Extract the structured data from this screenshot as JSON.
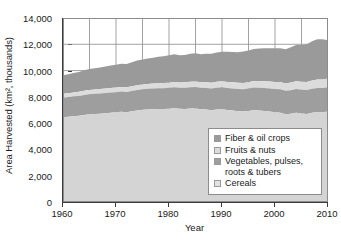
{
  "chart_data": {
    "type": "area",
    "title": "",
    "xlabel": "Year",
    "ylabel": "Area Harvested (km², thousands)",
    "xlim": [
      1960,
      2010
    ],
    "ylim": [
      0,
      14000
    ],
    "stacked": true,
    "grid": true,
    "grid_axis": "both",
    "legend_position": "inside-bottom-right",
    "ytick_labels": [
      "14,000",
      "12,000",
      "10,000",
      "8,000",
      "6,000",
      "4,000",
      "2,000",
      "0"
    ],
    "ytick_values": [
      14000,
      12000,
      10000,
      8000,
      6000,
      4000,
      2000,
      0
    ],
    "xtick_labels": [
      "1960",
      "1970",
      "1980",
      "1990",
      "2000",
      "2010"
    ],
    "xtick_values": [
      1960,
      1970,
      1980,
      1990,
      2000,
      2010
    ],
    "x": [
      1960,
      1961,
      1962,
      1963,
      1964,
      1965,
      1966,
      1967,
      1968,
      1969,
      1970,
      1971,
      1972,
      1973,
      1974,
      1975,
      1976,
      1977,
      1978,
      1979,
      1980,
      1981,
      1982,
      1983,
      1984,
      1985,
      1986,
      1987,
      1988,
      1989,
      1990,
      1991,
      1992,
      1993,
      1994,
      1995,
      1996,
      1997,
      1998,
      1999,
      2000,
      2001,
      2002,
      2003,
      2004,
      2005,
      2006,
      2007,
      2008,
      2009,
      2010
    ],
    "series": [
      {
        "name": "Cereals",
        "color": "#d4d4d4",
        "values": [
          6450,
          6480,
          6520,
          6560,
          6620,
          6680,
          6700,
          6720,
          6760,
          6800,
          6830,
          6860,
          6820,
          6900,
          6960,
          7010,
          7040,
          7060,
          7080,
          7070,
          7090,
          7130,
          7090,
          7080,
          7110,
          7120,
          7060,
          7030,
          6980,
          7040,
          7060,
          7000,
          6960,
          6900,
          6880,
          6920,
          6990,
          6960,
          6930,
          6890,
          6830,
          6800,
          6680,
          6720,
          6790,
          6740,
          6700,
          6790,
          6840,
          6820,
          6880
        ]
      },
      {
        "name": "Vegetables, pulses, roots & tubers",
        "color": "#9e9e9e",
        "values": [
          1480,
          1490,
          1510,
          1510,
          1520,
          1520,
          1530,
          1540,
          1540,
          1540,
          1530,
          1540,
          1550,
          1550,
          1560,
          1560,
          1570,
          1580,
          1580,
          1590,
          1600,
          1600,
          1610,
          1620,
          1620,
          1630,
          1640,
          1650,
          1660,
          1660,
          1670,
          1680,
          1680,
          1690,
          1700,
          1710,
          1720,
          1730,
          1740,
          1750,
          1760,
          1770,
          1780,
          1790,
          1800,
          1810,
          1820,
          1830,
          1840,
          1850,
          1860
        ]
      },
      {
        "name": "Fruits & nuts",
        "color": "#dcdcdc",
        "values": [
          300,
          305,
          310,
          315,
          318,
          320,
          325,
          330,
          335,
          340,
          345,
          350,
          355,
          358,
          362,
          366,
          370,
          375,
          380,
          385,
          390,
          395,
          400,
          405,
          410,
          415,
          420,
          428,
          435,
          442,
          450,
          458,
          466,
          474,
          482,
          490,
          500,
          510,
          520,
          530,
          540,
          552,
          564,
          576,
          588,
          600,
          612,
          624,
          636,
          648,
          660
        ]
      },
      {
        "name": "Fiber & oil crops",
        "color": "#9a9a9a",
        "values": [
          1420,
          1450,
          1470,
          1500,
          1560,
          1600,
          1630,
          1650,
          1680,
          1700,
          1730,
          1760,
          1780,
          1830,
          1880,
          1900,
          1930,
          1960,
          2010,
          2040,
          2080,
          2110,
          2060,
          2080,
          2140,
          2150,
          2120,
          2180,
          2210,
          2230,
          2260,
          2290,
          2300,
          2330,
          2380,
          2400,
          2440,
          2480,
          2500,
          2520,
          2560,
          2580,
          2600,
          2680,
          2760,
          2800,
          2880,
          2980,
          3060,
          3060,
          2900
        ]
      }
    ]
  },
  "legend": {
    "items": [
      {
        "label": "Fiber & oil crops",
        "color": "#9a9a9a"
      },
      {
        "label": "Fruits & nuts",
        "color": "#dcdcdc"
      },
      {
        "label": "Vegetables, pulses, roots & tubers",
        "color": "#9e9e9e"
      },
      {
        "label": "Cereals",
        "color": "#e2e2e2"
      }
    ]
  },
  "axes": {
    "x_title": "Year",
    "y_title": "Area Harvested (km², thousands)"
  },
  "style": {
    "grid_color": "#8c8c8c",
    "axis_color": "#3c3c3c",
    "text_color": "#1a1a1a",
    "background": "#ffffff"
  }
}
